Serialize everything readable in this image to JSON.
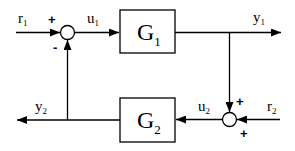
{
  "diagram": {
    "type": "feedback block diagram",
    "blocks": [
      {
        "id": "G1",
        "label": "G",
        "subscript": "1"
      },
      {
        "id": "G2",
        "label": "G",
        "subscript": "2"
      }
    ],
    "summing_junctions": [
      {
        "id": "sum1",
        "signs": {
          "left_input": "+",
          "bottom_input": "-"
        }
      },
      {
        "id": "sum2",
        "signs": {
          "top_input": "+",
          "right_input": "+"
        }
      }
    ],
    "signals": {
      "r1": {
        "label": "r",
        "subscript": "1"
      },
      "u1": {
        "label": "u",
        "subscript": "1"
      },
      "y1": {
        "label": "y",
        "subscript": "1"
      },
      "r2": {
        "label": "r",
        "subscript": "2"
      },
      "u2": {
        "label": "u",
        "subscript": "2"
      },
      "y2": {
        "label": "y",
        "subscript": "2"
      }
    },
    "colors": {
      "stroke": "#000000",
      "background": "#ffffff"
    }
  }
}
